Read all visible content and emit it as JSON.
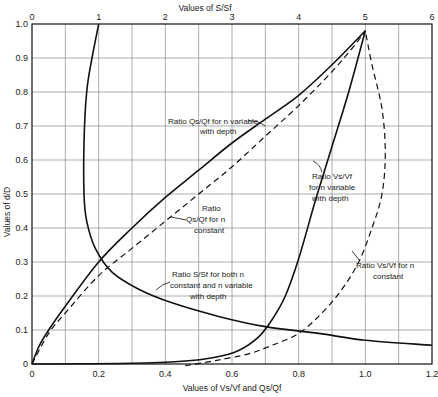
{
  "chart_data": {
    "type": "line",
    "title": "",
    "xlabel": "Values of Vs/Vf and Qs/Qf",
    "x2label": "Values of S/Sf",
    "ylabel": "Values of d/D",
    "xlim": [
      0,
      1.2
    ],
    "x2lim": [
      0,
      6
    ],
    "ylim": [
      0,
      1.0
    ],
    "grid": true,
    "x_ticks": [
      "0",
      "0.2",
      "0.4",
      "0.6",
      "0.8",
      "1.0",
      "1.2"
    ],
    "x2_ticks": [
      "0",
      "1",
      "2",
      "3",
      "4",
      "5",
      "6"
    ],
    "y_ticks": [
      "0",
      "0.1",
      "0.2",
      "0.3",
      "0.4",
      "0.5",
      "0.6",
      "0.7",
      "0.8",
      "0.9",
      "1.0"
    ],
    "series": [
      {
        "name": "Ratio Qs/Qf for n variable with depth",
        "axis": "bottom",
        "style": "solid",
        "x": [
          0,
          0.02,
          0.05,
          0.1,
          0.2,
          0.3,
          0.4,
          0.5,
          0.6,
          0.7,
          0.8,
          0.9,
          1.0
        ],
        "y": [
          0,
          0.05,
          0.1,
          0.17,
          0.3,
          0.4,
          0.49,
          0.57,
          0.65,
          0.72,
          0.79,
          0.88,
          0.98
        ]
      },
      {
        "name": "Ratio Qs/Qf for n constant",
        "axis": "bottom",
        "style": "dashed",
        "x": [
          0,
          0.05,
          0.1,
          0.2,
          0.3,
          0.4,
          0.5,
          0.6,
          0.7,
          0.8,
          0.9,
          0.97,
          1.0
        ],
        "y": [
          0,
          0.09,
          0.15,
          0.26,
          0.34,
          0.42,
          0.5,
          0.58,
          0.67,
          0.76,
          0.86,
          0.94,
          0.98
        ]
      },
      {
        "name": "Ratio Vs/Vf for n variable with depth",
        "axis": "bottom",
        "style": "solid",
        "x": [
          0,
          0.3,
          0.45,
          0.55,
          0.62,
          0.68,
          0.72,
          0.76,
          0.8,
          0.85,
          0.9,
          0.95,
          1.0
        ],
        "y": [
          0,
          0.002,
          0.008,
          0.02,
          0.04,
          0.08,
          0.13,
          0.2,
          0.31,
          0.48,
          0.64,
          0.8,
          0.98
        ]
      },
      {
        "name": "Ratio Vs/Vf for n constant",
        "axis": "bottom",
        "style": "dashed",
        "x": [
          0.46,
          0.55,
          0.65,
          0.72,
          0.8,
          0.87,
          0.93,
          0.98,
          1.02,
          1.05,
          1.06,
          1.05,
          1.02,
          1.0
        ],
        "y": [
          -0.005,
          0.01,
          0.03,
          0.055,
          0.09,
          0.15,
          0.22,
          0.3,
          0.4,
          0.5,
          0.62,
          0.75,
          0.88,
          0.98
        ]
      },
      {
        "name": "Ratio S/Sf for both n constant and n variable with depth",
        "axis": "top",
        "style": "solid",
        "x": [
          1.0,
          0.9,
          0.82,
          0.78,
          0.78,
          0.82,
          0.95,
          1.2,
          1.6,
          2.1,
          2.8,
          3.5,
          4.3,
          5.0,
          6.0
        ],
        "y": [
          1.0,
          0.9,
          0.8,
          0.65,
          0.5,
          0.42,
          0.34,
          0.27,
          0.22,
          0.18,
          0.14,
          0.11,
          0.09,
          0.07,
          0.055
        ]
      }
    ],
    "annotations": [
      {
        "text_lines": [
          "Ratio Qs/Qf for n variable",
          "with depth"
        ],
        "target": "Qs/Qf n variable"
      },
      {
        "text_lines": [
          "Ratio",
          "Qs/Qf for n",
          "constant"
        ],
        "target": "Qs/Qf n constant"
      },
      {
        "text_lines": [
          "Ratio Vs/Vf",
          "for n variable",
          "with depth"
        ],
        "target": "Vs/Vf n variable"
      },
      {
        "text_lines": [
          "Ratio Vs/Vf  for n",
          "constant"
        ],
        "target": "Vs/Vf n constant"
      },
      {
        "text_lines": [
          "Ratio S/Sf for both n",
          "constant and n variable",
          "with depth"
        ],
        "target": "S/Sf"
      }
    ]
  },
  "labels": {
    "top_axis": "Values of S/Sf",
    "bottom_axis": "Values of Vs/Vf and Qs/Qf",
    "left_axis": "Values of d/D"
  }
}
